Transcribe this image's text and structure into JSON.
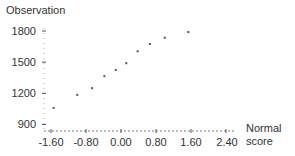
{
  "chart_data": {
    "type": "scatter",
    "title": "",
    "ylabel": "Observation",
    "xlabel": "Normal score",
    "xlabel_lines": [
      "Normal",
      "score"
    ],
    "x_ticks": [
      "-1.60",
      "-0.80",
      "0.00",
      "0.80",
      "1.60",
      "2.40"
    ],
    "y_ticks": [
      "1800",
      "1500",
      "1200",
      "900"
    ],
    "xlim": [
      -1.6,
      2.4
    ],
    "ylim": [
      900,
      1800
    ],
    "grid": false,
    "legend": null,
    "series": [
      {
        "name": "Observation vs Normal score",
        "x": [
          -1.54,
          -1.0,
          -0.66,
          -0.38,
          -0.12,
          0.12,
          0.38,
          0.66,
          1.0,
          1.54
        ],
        "y": [
          1060,
          1185,
          1250,
          1365,
          1425,
          1490,
          1605,
          1675,
          1735,
          1790
        ]
      }
    ],
    "colors": {
      "points": "#555555",
      "axis": "#555555",
      "text": "#333333"
    }
  }
}
